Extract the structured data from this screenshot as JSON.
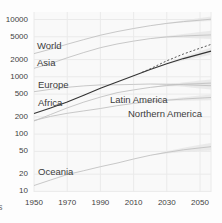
{
  "chart_data": {
    "type": "line",
    "title": "",
    "y_scale": "log",
    "grid": true,
    "xlim": [
      1950,
      2057
    ],
    "ylim": [
      10,
      13000
    ],
    "x_axis": {
      "tick_labels": [
        "1950",
        "1970",
        "1990",
        "2010",
        "2030",
        "2050"
      ],
      "tick_years": [
        1950,
        1970,
        1990,
        2010,
        2030,
        2050
      ]
    },
    "y_axis": {
      "tick_labels": [
        "10000",
        "5000",
        "2000",
        "1000",
        "500",
        "200",
        "100",
        "50",
        "20",
        "10"
      ],
      "tick_values": [
        10000,
        5000,
        2000,
        1000,
        500,
        200,
        100,
        50,
        20,
        10
      ]
    },
    "years": [
      1950,
      1960,
      1970,
      1980,
      1990,
      2000,
      2010,
      2020,
      2030,
      2040,
      2050
    ],
    "projection_interval_years": [
      2020,
      2030,
      2040,
      2050
    ],
    "series": [
      {
        "name": "World",
        "emphasis": false,
        "label_pos": [
          37,
          40
        ],
        "values": [
          2536,
          3033,
          3700,
          4458,
          5327,
          6143,
          6957,
          7795,
          8548,
          9199,
          9735
        ],
        "pi_low": [
          7795,
          8400,
          8900,
          9200
        ],
        "pi_high": [
          7795,
          8700,
          9600,
          10600
        ]
      },
      {
        "name": "Asia",
        "emphasis": false,
        "label_pos": [
          37,
          57
        ],
        "values": [
          1405,
          1705,
          2142,
          2650,
          3226,
          3741,
          4194,
          4641,
          4974,
          5154,
          5290
        ],
        "pi_low": [
          4641,
          4800,
          4800,
          4650
        ],
        "pi_high": [
          4641,
          5150,
          5600,
          6050
        ]
      },
      {
        "name": "Europe",
        "emphasis": false,
        "label_pos": [
          38,
          79
        ],
        "values": [
          549,
          605,
          657,
          694,
          721,
          726,
          736,
          748,
          741,
          728,
          710
        ],
        "pi_low": [
          748,
          715,
          670,
          625
        ],
        "pi_high": [
          748,
          765,
          785,
          805
        ]
      },
      {
        "name": "Africa",
        "emphasis": true,
        "label_pos": [
          38,
          97
        ],
        "values": [
          228,
          285,
          363,
          478,
          630,
          811,
          1039,
          1341,
          1688,
          2077,
          2489
        ],
        "pi_low": [
          1341,
          1640,
          1930,
          2210
        ],
        "pi_high": [
          1341,
          1740,
          2230,
          2800
        ]
      },
      {
        "name": "Latin America",
        "emphasis": false,
        "label_pos": [
          110,
          93.5
        ],
        "values": [
          169,
          220,
          287,
          362,
          443,
          527,
          591,
          654,
          706,
          742,
          762
        ],
        "pi_low": [
          654,
          680,
          690,
          685
        ],
        "pi_high": [
          654,
          730,
          800,
          860
        ]
      },
      {
        "name": "Northern America",
        "emphasis": false,
        "label_pos": [
          128,
          107.5
        ],
        "values": [
          173,
          204,
          231,
          254,
          280,
          313,
          343,
          369,
          391,
          409,
          425
        ],
        "pi_low": [
          369,
          376,
          382,
          387
        ],
        "pi_high": [
          369,
          405,
          441,
          470
        ]
      },
      {
        "name": "Oceania",
        "emphasis": false,
        "label_pos": [
          38,
          165.5
        ],
        "values": [
          12.7,
          15.8,
          19.7,
          23,
          27,
          31.2,
          36.7,
          42.7,
          48,
          53.3,
          57.4
        ],
        "pi_low": [
          42.7,
          46,
          48.5,
          50.5
        ],
        "pi_high": [
          42.7,
          50,
          58,
          65
        ]
      }
    ],
    "variant": {
      "name": "Africa high variant",
      "style": "dashed",
      "years": [
        2015,
        2020,
        2030,
        2040,
        2050
      ],
      "values": [
        1194,
        1380,
        1900,
        2500,
        3150
      ]
    },
    "colors": {
      "line_default": "#c2c2c2",
      "line_emphasis": "#333333",
      "variant_line": "#444444",
      "band": "#e4e4e4",
      "grid": "#eaeaea",
      "plot_background": "#f9f9f9",
      "text": "#3d3d3d"
    }
  },
  "edge_text": "s"
}
